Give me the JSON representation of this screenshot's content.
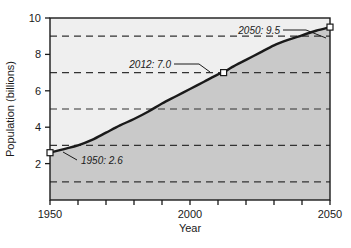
{
  "chart_data": {
    "type": "line",
    "title": "",
    "xlabel": "Year",
    "ylabel": "Population (billions)",
    "xlim": [
      1950,
      2050
    ],
    "ylim": [
      0,
      10
    ],
    "grid": true,
    "grid_axis": "y",
    "grid_style": "dashed",
    "gridline_values": [
      1,
      3,
      5,
      7,
      9
    ],
    "legend": "none",
    "x_tick_labels": [
      "1950",
      "2000",
      "2050"
    ],
    "x_tick_label_values": [
      1950,
      2000,
      2050
    ],
    "x_minor_tick_values": [
      1950,
      1960,
      1970,
      1980,
      1990,
      2000,
      2010,
      2020,
      2030,
      2040,
      2050
    ],
    "y_tick_labels": [
      "2",
      "4",
      "6",
      "8",
      "10"
    ],
    "y_tick_label_values": [
      2,
      4,
      6,
      8,
      10
    ],
    "series": [
      {
        "name": "World population",
        "x": [
          1950,
          1955,
          1960,
          1965,
          1970,
          1975,
          1980,
          1985,
          1990,
          1995,
          2000,
          2005,
          2010,
          2012,
          2015,
          2020,
          2025,
          2030,
          2035,
          2040,
          2045,
          2050
        ],
        "values": [
          2.6,
          2.8,
          3.0,
          3.3,
          3.7,
          4.1,
          4.45,
          4.85,
          5.3,
          5.7,
          6.1,
          6.5,
          6.9,
          7.0,
          7.3,
          7.7,
          8.1,
          8.5,
          8.8,
          9.05,
          9.3,
          9.5
        ]
      }
    ],
    "markers": [
      {
        "label": "1950: 2.6",
        "x": 1950,
        "y": 2.6
      },
      {
        "label": "2012: 7.0",
        "x": 2012,
        "y": 7.0
      },
      {
        "label": "2050: 9.5",
        "x": 2050,
        "y": 9.5
      }
    ],
    "annotations": [
      {
        "id": "m1950",
        "text": "1950: 2.6"
      },
      {
        "id": "m2012",
        "text": "2012: 7.0"
      },
      {
        "id": "m2050",
        "text": "2050: 9.5"
      }
    ],
    "colors": {
      "area_below_curve": "#c9c9c9",
      "area_above_curve": "#efefef",
      "curve": "#1a1a1a",
      "gridline": "#333333",
      "axis": "#1a1a1a",
      "marker_fill": "#ffffff",
      "background": "#ffffff"
    }
  }
}
